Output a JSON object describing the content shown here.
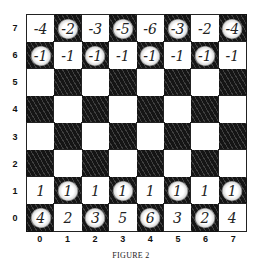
{
  "caption": "FIGURE 2",
  "colors": {
    "dark_square": "#151515",
    "light_square": "#ffffff",
    "ink": "#222222"
  },
  "rank_labels": [
    "7",
    "6",
    "5",
    "4",
    "3",
    "2",
    "1",
    "0"
  ],
  "file_labels": [
    "0",
    "1",
    "2",
    "3",
    "4",
    "5",
    "6",
    "7"
  ],
  "board": {
    "rows": [
      {
        "rank": "7",
        "cells": [
          "-4",
          "-2",
          "-3",
          "-5",
          "-6",
          "-3",
          "-2",
          "-4"
        ]
      },
      {
        "rank": "6",
        "cells": [
          "-1",
          "-1",
          "-1",
          "-1",
          "-1",
          "-1",
          "-1",
          "-1"
        ]
      },
      {
        "rank": "5",
        "cells": [
          "",
          "",
          "",
          "",
          "",
          "",
          "",
          ""
        ]
      },
      {
        "rank": "4",
        "cells": [
          "",
          "",
          "",
          "",
          "",
          "",
          "",
          ""
        ]
      },
      {
        "rank": "3",
        "cells": [
          "",
          "",
          "",
          "",
          "",
          "",
          "",
          ""
        ]
      },
      {
        "rank": "2",
        "cells": [
          "",
          "",
          "",
          "",
          "",
          "",
          "",
          ""
        ]
      },
      {
        "rank": "1",
        "cells": [
          "1",
          "1",
          "1",
          "1",
          "1",
          "1",
          "1",
          "1"
        ]
      },
      {
        "rank": "0",
        "cells": [
          "4",
          "2",
          "3",
          "5",
          "6",
          "3",
          "2",
          "4"
        ]
      }
    ]
  }
}
